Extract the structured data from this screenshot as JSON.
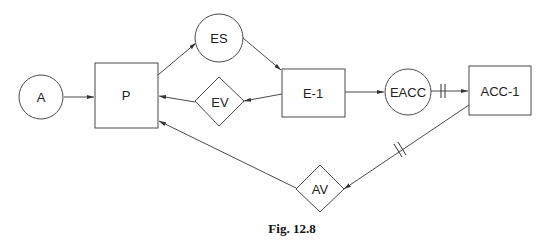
{
  "figure": {
    "caption": "Fig. 12.8"
  },
  "nodes": {
    "A": {
      "label": "A",
      "shape": "circle"
    },
    "P": {
      "label": "P",
      "shape": "rectangle"
    },
    "ES": {
      "label": "ES",
      "shape": "circle"
    },
    "EV": {
      "label": "EV",
      "shape": "diamond"
    },
    "E1": {
      "label": "E-1",
      "shape": "rectangle"
    },
    "EACC": {
      "label": "EACC",
      "shape": "circle"
    },
    "ACC1": {
      "label": "ACC-1",
      "shape": "rectangle"
    },
    "AV": {
      "label": "AV",
      "shape": "diamond"
    }
  },
  "edges": [
    {
      "from": "A",
      "to": "P",
      "marker": "none"
    },
    {
      "from": "P",
      "to": "ES",
      "marker": "none"
    },
    {
      "from": "ES",
      "to": "E-1",
      "marker": "none"
    },
    {
      "from": "E-1",
      "to": "EV",
      "marker": "none"
    },
    {
      "from": "EV",
      "to": "P",
      "marker": "none"
    },
    {
      "from": "E-1",
      "to": "EACC",
      "marker": "none"
    },
    {
      "from": "EACC",
      "to": "ACC-1",
      "marker": "double-bar"
    },
    {
      "from": "ACC-1",
      "to": "AV",
      "marker": "double-bar"
    },
    {
      "from": "AV",
      "to": "P",
      "marker": "none"
    }
  ],
  "colors": {
    "stroke": "#4a4a4a",
    "text": "#222222",
    "background": "#ffffff"
  }
}
